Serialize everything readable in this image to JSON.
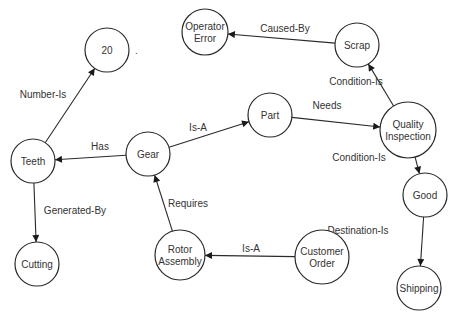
{
  "diagram": {
    "type": "semantic-network",
    "nodes": [
      {
        "id": "n20",
        "lines": [
          "20"
        ],
        "x": 107,
        "y": 50,
        "r": 22
      },
      {
        "id": "operator_error",
        "lines": [
          "Operator",
          "Error"
        ],
        "x": 205,
        "y": 32,
        "r": 23
      },
      {
        "id": "scrap",
        "lines": [
          "Scrap"
        ],
        "x": 357,
        "y": 45,
        "r": 22
      },
      {
        "id": "part",
        "lines": [
          "Part"
        ],
        "x": 270,
        "y": 115,
        "r": 22
      },
      {
        "id": "quality_inspection",
        "lines": [
          "Quality",
          "Inspection"
        ],
        "x": 408,
        "y": 130,
        "r": 28
      },
      {
        "id": "teeth",
        "lines": [
          "Teeth"
        ],
        "x": 33,
        "y": 161,
        "r": 22
      },
      {
        "id": "gear",
        "lines": [
          "Gear"
        ],
        "x": 148,
        "y": 154,
        "r": 22
      },
      {
        "id": "good",
        "lines": [
          "Good"
        ],
        "x": 425,
        "y": 195,
        "r": 22
      },
      {
        "id": "cutting",
        "lines": [
          "Cutting"
        ],
        "x": 37,
        "y": 264,
        "r": 22
      },
      {
        "id": "rotor_assembly",
        "lines": [
          "Rotor",
          "Assembly"
        ],
        "x": 180,
        "y": 255,
        "r": 25
      },
      {
        "id": "customer_order",
        "lines": [
          "Customer",
          "Order"
        ],
        "x": 322,
        "y": 257,
        "r": 27
      },
      {
        "id": "shipping",
        "lines": [
          "Shipping"
        ],
        "x": 419,
        "y": 288,
        "r": 22
      }
    ],
    "edges": [
      {
        "from": "teeth",
        "to": "n20",
        "label": "Number-Is",
        "lx": 43,
        "ly": 98
      },
      {
        "from": "gear",
        "to": "teeth",
        "label": "Has",
        "lx": 100,
        "ly": 150
      },
      {
        "from": "gear",
        "to": "part",
        "label": "Is-A",
        "lx": 198,
        "ly": 131
      },
      {
        "from": "teeth",
        "to": "cutting",
        "label": "Generated-By",
        "lx": 75,
        "ly": 214
      },
      {
        "from": "rotor_assembly",
        "to": "gear",
        "label": "Requires",
        "lx": 188,
        "ly": 207
      },
      {
        "from": "customer_order",
        "to": "rotor_assembly",
        "label": "Is-A",
        "lx": 251,
        "ly": 252
      },
      {
        "from": "part",
        "to": "quality_inspection",
        "label": "Needs",
        "lx": 327,
        "ly": 109
      },
      {
        "from": "quality_inspection",
        "to": "scrap",
        "label": "Condition-Is",
        "lx": 356,
        "ly": 85
      },
      {
        "from": "scrap",
        "to": "operator_error",
        "label": "Caused-By",
        "lx": 285,
        "ly": 32
      },
      {
        "from": "quality_inspection",
        "to": "good",
        "label": "Condition-Is",
        "lx": 359,
        "ly": 161
      },
      {
        "from": "good",
        "to": "shipping",
        "label": "Destination-Is",
        "lx": 358,
        "ly": 234
      }
    ],
    "stray_mark": {
      "text": ".",
      "x": 135,
      "y": 54
    }
  }
}
